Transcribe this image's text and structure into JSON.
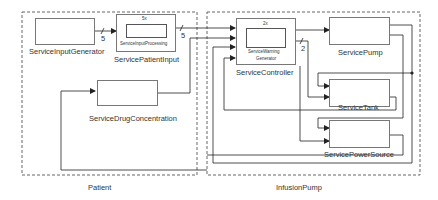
{
  "groups": {
    "patient": "Patient",
    "infusion_pump": "InfusionPump"
  },
  "blocks": {
    "service_input_generator": "ServiceInputGenerator",
    "service_patient_input": "ServicePatientInput",
    "service_input_processing": "ServiceInputProcessing",
    "service_input_processing_mult": "5x",
    "service_drug_concentration": "ServiceDrugConcentration",
    "service_controller": "ServiceController",
    "service_warning_generator_line1": "ServiceWarning",
    "service_warning_generator_line2": "Generator",
    "service_warning_generator_mult": "2x",
    "service_pump": "ServicePump",
    "service_tank": "ServiceTank",
    "service_power_source": "ServicePowerSource"
  },
  "bus_widths": {
    "generator_to_patient_input": "5",
    "patient_input_to_controller": "5",
    "controller_to_tank": "2"
  }
}
